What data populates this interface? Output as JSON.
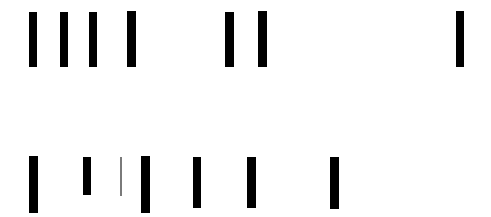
{
  "canvas": {
    "width": 491,
    "height": 217,
    "background": "#ffffff",
    "mark_color": "#000000",
    "thin_mark_color": "#7a7a7a"
  },
  "rows": [
    {
      "name": "top-bar-row",
      "label": "top-row",
      "count": 7,
      "marks": [
        {
          "name": "mark-1",
          "x": 29,
          "y": 12,
          "width": 8,
          "height": 55,
          "color": "#000000",
          "weight": "heavy"
        },
        {
          "name": "mark-2",
          "x": 60,
          "y": 12,
          "width": 8,
          "height": 55,
          "color": "#000000",
          "weight": "heavy"
        },
        {
          "name": "mark-3",
          "x": 89,
          "y": 12,
          "width": 8,
          "height": 55,
          "color": "#000000",
          "weight": "heavy"
        },
        {
          "name": "mark-4",
          "x": 127,
          "y": 11,
          "width": 9,
          "height": 56,
          "color": "#000000",
          "weight": "heavy"
        },
        {
          "name": "mark-5",
          "x": 225,
          "y": 12,
          "width": 9,
          "height": 55,
          "color": "#000000",
          "weight": "heavy"
        },
        {
          "name": "mark-6",
          "x": 258,
          "y": 11,
          "width": 9,
          "height": 56,
          "color": "#000000",
          "weight": "heavy"
        },
        {
          "name": "mark-7",
          "x": 456,
          "y": 11,
          "width": 8,
          "height": 56,
          "color": "#000000",
          "weight": "heavy"
        }
      ]
    },
    {
      "name": "bottom-bar-row",
      "label": "bottom-row",
      "count": 7,
      "marks": [
        {
          "name": "mark-1",
          "x": 29,
          "y": 156,
          "width": 9,
          "height": 57,
          "color": "#000000",
          "weight": "heavy"
        },
        {
          "name": "mark-2",
          "x": 83,
          "y": 157,
          "width": 8,
          "height": 38,
          "color": "#000000",
          "weight": "heavy"
        },
        {
          "name": "mark-3",
          "x": 120,
          "y": 157,
          "width": 2,
          "height": 39,
          "color": "#7a7a7a",
          "weight": "thin"
        },
        {
          "name": "mark-4",
          "x": 141,
          "y": 156,
          "width": 9,
          "height": 57,
          "color": "#000000",
          "weight": "heavy"
        },
        {
          "name": "mark-5",
          "x": 193,
          "y": 157,
          "width": 8,
          "height": 51,
          "color": "#000000",
          "weight": "heavy"
        },
        {
          "name": "mark-6",
          "x": 247,
          "y": 157,
          "width": 9,
          "height": 51,
          "color": "#000000",
          "weight": "heavy"
        },
        {
          "name": "mark-7",
          "x": 330,
          "y": 157,
          "width": 9,
          "height": 52,
          "color": "#000000",
          "weight": "heavy"
        }
      ]
    }
  ]
}
